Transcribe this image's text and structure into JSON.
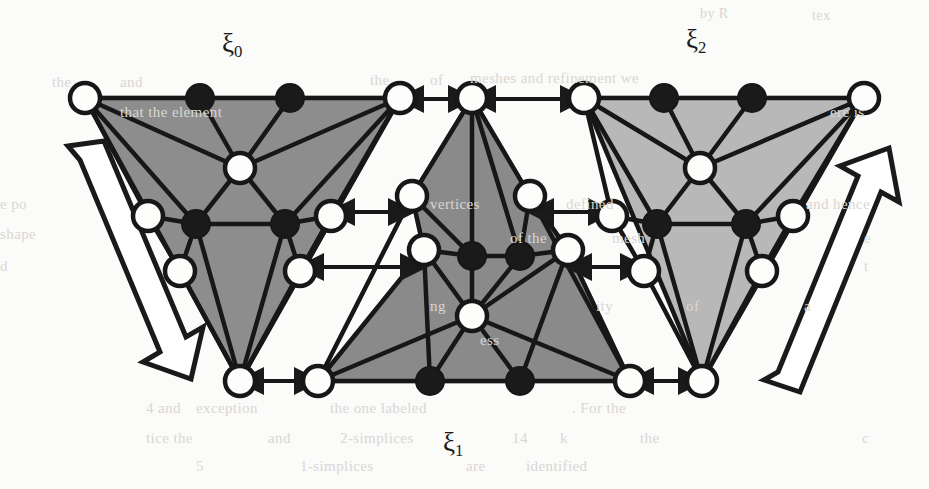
{
  "figure": {
    "width": 929,
    "height": 489,
    "background_color": "#fbfbf9",
    "caption_labels": [
      {
        "id": "xi0",
        "text": "ξ",
        "subscript": "0",
        "x": 222,
        "y": 28
      },
      {
        "id": "xi1",
        "text": "ξ",
        "subscript": "1",
        "x": 443,
        "y": 427
      },
      {
        "id": "xi2",
        "text": "ξ",
        "subscript": "2",
        "x": 686,
        "y": 24
      }
    ],
    "colors": {
      "fill_dark_gray": "#8d8d8d",
      "fill_mid_gray": "#8a8a8a",
      "fill_light_gray": "#b8b8b8",
      "stroke_black": "#171717",
      "node_white_fill": "#fdfdfb",
      "node_black_fill": "#1a1a1a",
      "arrow_fill": "#ffffff",
      "arrow_stroke": "#1a1a1a",
      "background_text": "#d9d7d2"
    },
    "geometry": {
      "node_radius_white": 15,
      "node_radius_black": 14,
      "edge_stroke_width": 4.5,
      "node_stroke_width": 4.5
    },
    "panels": [
      {
        "id": "xi0",
        "label": "ξ0",
        "orientation": "inverted",
        "fill": "#8d8d8d",
        "nodes": [
          {
            "id": "t0",
            "x": 85,
            "y": 98,
            "type": "white"
          },
          {
            "id": "t1",
            "x": 200,
            "y": 98,
            "type": "black"
          },
          {
            "id": "t2",
            "x": 290,
            "y": 98,
            "type": "black"
          },
          {
            "id": "t3",
            "x": 400,
            "y": 98,
            "type": "white"
          },
          {
            "id": "c0",
            "x": 240,
            "y": 168,
            "type": "white"
          },
          {
            "id": "m0",
            "x": 148,
            "y": 216,
            "type": "white"
          },
          {
            "id": "m1",
            "x": 196,
            "y": 224,
            "type": "black"
          },
          {
            "id": "m2",
            "x": 285,
            "y": 224,
            "type": "black"
          },
          {
            "id": "m3",
            "x": 331,
            "y": 216,
            "type": "white"
          },
          {
            "id": "l0",
            "x": 180,
            "y": 271,
            "type": "white"
          },
          {
            "id": "l1",
            "x": 300,
            "y": 271,
            "type": "white"
          },
          {
            "id": "b0",
            "x": 240,
            "y": 381,
            "type": "white"
          }
        ]
      },
      {
        "id": "xi1",
        "label": "ξ1",
        "orientation": "upright",
        "fill": "#8a8a8a",
        "nodes": [
          {
            "id": "apex",
            "x": 472,
            "y": 98,
            "type": "white"
          },
          {
            "id": "u0",
            "x": 412,
            "y": 196,
            "type": "white"
          },
          {
            "id": "u1",
            "x": 530,
            "y": 196,
            "type": "white"
          },
          {
            "id": "m0",
            "x": 424,
            "y": 250,
            "type": "white"
          },
          {
            "id": "m1",
            "x": 472,
            "y": 256,
            "type": "black"
          },
          {
            "id": "m2",
            "x": 520,
            "y": 256,
            "type": "black"
          },
          {
            "id": "m3",
            "x": 568,
            "y": 250,
            "type": "white"
          },
          {
            "id": "c0",
            "x": 472,
            "y": 316,
            "type": "white"
          },
          {
            "id": "b0",
            "x": 318,
            "y": 381,
            "type": "white"
          },
          {
            "id": "b1",
            "x": 430,
            "y": 381,
            "type": "black"
          },
          {
            "id": "b2",
            "x": 520,
            "y": 381,
            "type": "black"
          },
          {
            "id": "b3",
            "x": 630,
            "y": 381,
            "type": "white"
          }
        ]
      },
      {
        "id": "xi2",
        "label": "ξ2",
        "orientation": "inverted",
        "fill": "#b8b8b8",
        "nodes": [
          {
            "id": "t0",
            "x": 584,
            "y": 98,
            "type": "white"
          },
          {
            "id": "t1",
            "x": 664,
            "y": 98,
            "type": "black"
          },
          {
            "id": "t2",
            "x": 752,
            "y": 98,
            "type": "black"
          },
          {
            "id": "t3",
            "x": 864,
            "y": 98,
            "type": "white"
          },
          {
            "id": "c0",
            "x": 700,
            "y": 168,
            "type": "white"
          },
          {
            "id": "m0",
            "x": 612,
            "y": 216,
            "type": "white"
          },
          {
            "id": "m1",
            "x": 657,
            "y": 224,
            "type": "black"
          },
          {
            "id": "m2",
            "x": 746,
            "y": 224,
            "type": "black"
          },
          {
            "id": "m3",
            "x": 793,
            "y": 216,
            "type": "white"
          },
          {
            "id": "l0",
            "x": 644,
            "y": 271,
            "type": "white"
          },
          {
            "id": "l1",
            "x": 762,
            "y": 271,
            "type": "white"
          },
          {
            "id": "b0",
            "x": 702,
            "y": 381,
            "type": "white"
          }
        ]
      }
    ],
    "interface_arrows": [
      {
        "id": "arrow-top-left",
        "x1": 420,
        "y1": 99,
        "x2": 452,
        "y2": 99
      },
      {
        "id": "arrow-top-right",
        "x1": 492,
        "y1": 99,
        "x2": 564,
        "y2": 99
      },
      {
        "id": "arrow-mid-left-a",
        "x1": 351,
        "y1": 212,
        "x2": 392,
        "y2": 212
      },
      {
        "id": "arrow-mid-right-a",
        "x1": 550,
        "y1": 212,
        "x2": 592,
        "y2": 212
      },
      {
        "id": "arrow-mid-left-b",
        "x1": 320,
        "y1": 267,
        "x2": 404,
        "y2": 267
      },
      {
        "id": "arrow-mid-right-b",
        "x1": 588,
        "y1": 267,
        "x2": 624,
        "y2": 267
      },
      {
        "id": "arrow-bottom-left",
        "x1": 260,
        "y1": 381,
        "x2": 298,
        "y2": 381
      },
      {
        "id": "arrow-bottom-right",
        "x1": 650,
        "y1": 381,
        "x2": 682,
        "y2": 381
      }
    ],
    "block_arrows": [
      {
        "id": "block-arrow-left",
        "direction": "down-right",
        "fill": "#ffffff",
        "stroke": "#1a1a1a",
        "points": "68,146 104,141 186,337 203,327 191,379 143,362 160,352 80,160"
      },
      {
        "id": "block-arrow-right",
        "direction": "up-right",
        "fill": "#ffffff",
        "stroke": "#1a1a1a",
        "points": "764,380 800,392 881,192 899,202 889,148 840,166 858,176 778,372"
      }
    ],
    "background_text_lines": [
      {
        "text": "tex",
        "x": 812,
        "y": 8,
        "size": 14
      },
      {
        "text": "by R",
        "x": 700,
        "y": 6,
        "size": 14
      },
      {
        "text": "the",
        "x": 52,
        "y": 74,
        "size": 15
      },
      {
        "text": "and",
        "x": 120,
        "y": 74,
        "size": 15
      },
      {
        "text": "the",
        "x": 370,
        "y": 72,
        "size": 15
      },
      {
        "text": "of",
        "x": 430,
        "y": 72,
        "size": 15
      },
      {
        "text": "meshes and refinement we",
        "x": 470,
        "y": 70,
        "size": 15
      },
      {
        "text": "that the element",
        "x": 120,
        "y": 104,
        "size": 15
      },
      {
        "text": "ere is",
        "x": 830,
        "y": 104,
        "size": 15
      },
      {
        "text": "e po",
        "x": 0,
        "y": 196,
        "size": 15
      },
      {
        "text": "vertices",
        "x": 430,
        "y": 196,
        "size": 15
      },
      {
        "text": "defined",
        "x": 566,
        "y": 196,
        "size": 15
      },
      {
        "text": "and hence",
        "x": 806,
        "y": 196,
        "size": 15
      },
      {
        "text": "shape",
        "x": 0,
        "y": 226,
        "size": 15
      },
      {
        "text": "of the",
        "x": 510,
        "y": 230,
        "size": 15
      },
      {
        "text": "mesh",
        "x": 612,
        "y": 230,
        "size": 15
      },
      {
        "text": "e",
        "x": 864,
        "y": 230,
        "size": 15
      },
      {
        "text": "d",
        "x": 0,
        "y": 258,
        "size": 15
      },
      {
        "text": "t",
        "x": 864,
        "y": 258,
        "size": 15
      },
      {
        "text": "ng",
        "x": 430,
        "y": 298,
        "size": 15
      },
      {
        "text": "ity",
        "x": 596,
        "y": 298,
        "size": 15
      },
      {
        "text": "of",
        "x": 686,
        "y": 298,
        "size": 15
      },
      {
        "text": "a",
        "x": 804,
        "y": 298,
        "size": 15
      },
      {
        "text": "ess",
        "x": 480,
        "y": 332,
        "size": 15
      },
      {
        "text": "4 and",
        "x": 146,
        "y": 400,
        "size": 15
      },
      {
        "text": "exception",
        "x": 196,
        "y": 400,
        "size": 15
      },
      {
        "text": "the one labeled",
        "x": 330,
        "y": 400,
        "size": 15
      },
      {
        "text": ". For the",
        "x": 572,
        "y": 400,
        "size": 15
      },
      {
        "text": "tice the",
        "x": 146,
        "y": 430,
        "size": 15
      },
      {
        "text": "and",
        "x": 268,
        "y": 430,
        "size": 15
      },
      {
        "text": "2-simplices",
        "x": 340,
        "y": 430,
        "size": 15
      },
      {
        "text": "14",
        "x": 512,
        "y": 430,
        "size": 15
      },
      {
        "text": "k",
        "x": 560,
        "y": 430,
        "size": 15
      },
      {
        "text": "the",
        "x": 640,
        "y": 430,
        "size": 15
      },
      {
        "text": "c",
        "x": 862,
        "y": 430,
        "size": 15
      },
      {
        "text": "5",
        "x": 196,
        "y": 458,
        "size": 15
      },
      {
        "text": "1-simplices",
        "x": 300,
        "y": 458,
        "size": 15
      },
      {
        "text": "are",
        "x": 466,
        "y": 458,
        "size": 15
      },
      {
        "text": "identified",
        "x": 526,
        "y": 458,
        "size": 15
      }
    ]
  }
}
